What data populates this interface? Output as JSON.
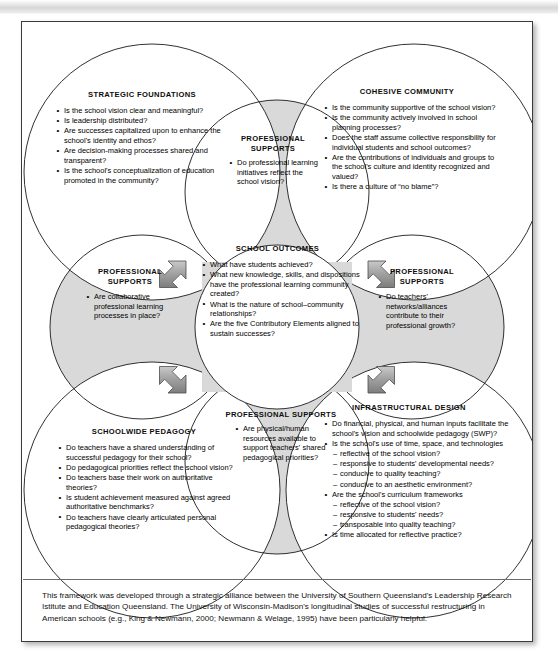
{
  "diagram": {
    "colors": {
      "gray_fill": "#d9d9d9",
      "white_fill": "#ffffff",
      "stroke": "#1a1a1a",
      "arrow_fill": "#a6a6a6",
      "page_border": "#3a3a3a"
    },
    "nodes": [
      {
        "id": "strategic-foundations",
        "heading": "STRATEGIC FOUNDATIONS",
        "shape": "circle",
        "fill": "white",
        "items": [
          "Is the school vision clear and meaningful?",
          "Is leadership distributed?",
          "Are successes capitalized upon to enhance the school's identity and ethos?",
          "Are decision-making processes shared and transparent?",
          "Is the school's conceptualization of education promoted in the community?"
        ]
      },
      {
        "id": "cohesive-community",
        "heading": "COHESIVE COMMUNITY",
        "shape": "circle",
        "fill": "white",
        "items": [
          "Is the community supportive of the school vision?",
          "Is the community actively involved in school planning processes?",
          "Does the staff assume collective responsibility for individual students and school outcomes?",
          "Are the contributions of individuals and groups to the school's culture and identity recognized and valued?",
          "Is there a culture of “no blame”?"
        ]
      },
      {
        "id": "school-outcomes",
        "heading": "SCHOOL OUTCOMES",
        "shape": "circle",
        "fill": "white",
        "items": [
          "What have students achieved?",
          "What new knowledge, skills, and dispositions have the professional learning community created?",
          "What is the nature of school–community relationships?",
          "Are the five Contributory Elements aligned to sustain successes?"
        ]
      },
      {
        "id": "schoolwide-pedagogy",
        "heading": "SCHOOLWIDE PEDAGOGY",
        "shape": "circle",
        "fill": "white",
        "items": [
          "Do teachers have a shared understanding of successful pedagogy for their school?",
          "Do pedagogical priorities reflect the school vision?",
          "Do teachers base their work on authoritative theories?",
          "Is student achievement measured against agreed authoritative benchmarks?",
          "Do teachers have clearly articulated personal pedagogical theories?"
        ]
      },
      {
        "id": "infrastructural-design",
        "heading": "INFRASTRUCTURAL DESIGN",
        "shape": "circle",
        "fill": "white",
        "items": [
          {
            "text": "Do financial, physical, and human inputs facilitate the school's vision and schoolwide pedagogy (SWP)?",
            "level": 1
          },
          {
            "text": "Is the school's use of time, space, and technologies",
            "level": 1
          },
          {
            "text": "reflective of the school vision?",
            "level": 2
          },
          {
            "text": "responsive to students' developmental needs?",
            "level": 2
          },
          {
            "text": "conducive to quality teaching?",
            "level": 2
          },
          {
            "text": "conducive to an aesthetic environment?",
            "level": 2
          },
          {
            "text": "Are the school's curriculum frameworks",
            "level": 1
          },
          {
            "text": "reflective of the school vision?",
            "level": 2
          },
          {
            "text": "responsive to students' needs?",
            "level": 2
          },
          {
            "text": "transposable into quality teaching?",
            "level": 2
          },
          {
            "text": "Is time allocated for reflective practice?",
            "level": 1
          }
        ]
      }
    ],
    "professional_supports": [
      {
        "id": "ps-top",
        "heading_line1": "PROFESSIONAL",
        "heading_line2": "SUPPORTS",
        "items": [
          "Do professional learning initiatives reflect the school vision?"
        ]
      },
      {
        "id": "ps-left",
        "heading_line1": "PROFESSIONAL",
        "heading_line2": "SUPPORTS",
        "items": [
          "Are collaborative professional learning processes in place?"
        ]
      },
      {
        "id": "ps-right",
        "heading_line1": "PROFESSIONAL",
        "heading_line2": "SUPPORTS",
        "items": [
          "Do teachers' networks/alliances contribute to their professional growth?"
        ]
      },
      {
        "id": "ps-bottom",
        "heading_line1": "PROFESSIONAL SUPPORTS",
        "heading_line2": "",
        "items": [
          "Are physical/human resources available to support teachers' shared pedagogical priorities?"
        ]
      }
    ],
    "arrows": [
      {
        "id": "arrow-top-left",
        "direction": "double-headed-diagonal-nwse"
      },
      {
        "id": "arrow-top-right",
        "direction": "double-headed-diagonal-nesw"
      },
      {
        "id": "arrow-bottom-left",
        "direction": "double-headed-diagonal-nesw"
      },
      {
        "id": "arrow-bottom-right",
        "direction": "double-headed-diagonal-nwse"
      }
    ],
    "caption": "This framework was developed through a strategic alliance between the University of Southern Queensland's Leadership Research Istitute and Education Queensland. The University of Wisconsin-Madison's longitudinal studies of successful restructuring in American schools (e.g., King & Newmann, 2000; Newmann & Welage, 1995) have been particularly helpful."
  }
}
